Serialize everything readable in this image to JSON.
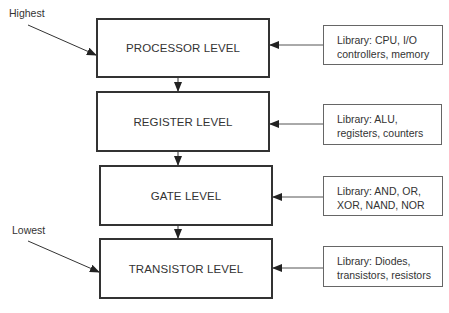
{
  "diagram": {
    "labels": {
      "highest": "Highest",
      "lowest": "Lowest"
    },
    "levels": [
      {
        "name": "PROCESSOR LEVEL",
        "library_line1": "Library: CPU, I/O",
        "library_line2": "controllers, memory"
      },
      {
        "name": "REGISTER LEVEL",
        "library_line1": "Library: ALU,",
        "library_line2": "registers, counters"
      },
      {
        "name": "GATE LEVEL",
        "library_line1": "Library: AND, OR,",
        "library_line2": "XOR, NAND, NOR"
      },
      {
        "name": "TRANSISTOR LEVEL",
        "library_line1": "Library: Diodes,",
        "library_line2": "transistors, resistors"
      }
    ],
    "colors": {
      "stroke": "#333333",
      "background": "#ffffff"
    }
  }
}
